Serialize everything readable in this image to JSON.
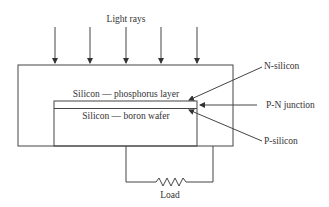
{
  "diagram": {
    "title_label": "Light rays",
    "layers": {
      "top": "Silicon — phosphorus layer",
      "bottom": "Silicon — boron wafer"
    },
    "callouts": {
      "n_silicon": "N-silicon",
      "pn_junction": "P-N junction",
      "p_silicon": "P-silicon"
    },
    "load_label": "Load",
    "ray_count": 5
  }
}
